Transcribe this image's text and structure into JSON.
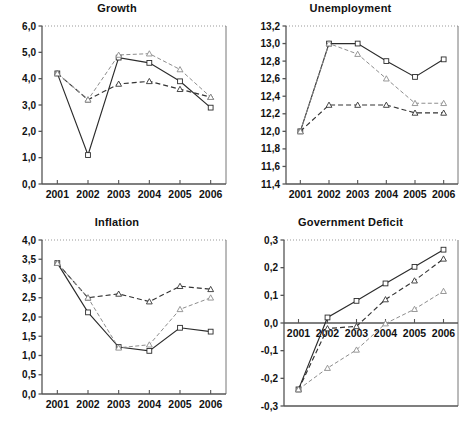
{
  "figure": {
    "background": "#ffffff",
    "panel_count": 4
  },
  "panels": [
    {
      "name": "growth",
      "title": "Growth",
      "ylabel": "",
      "xlabel": ""
    },
    {
      "name": "unemployment",
      "title": "Unemployment",
      "ylabel": "",
      "xlabel": ""
    },
    {
      "name": "inflation",
      "title": "Inflation",
      "ylabel": "",
      "xlabel": ""
    },
    {
      "name": "government-deficit",
      "title": "Government Deficit",
      "ylabel": "",
      "xlabel": ""
    }
  ],
  "style": {
    "series_colors": [
      "#2b2b2b",
      "#333333",
      "#8d8d8d"
    ],
    "axis_color": "#555555",
    "frame_color": "#777777",
    "gridline_top_color": "#999999"
  },
  "chart_data": [
    {
      "type": "line",
      "title": "Growth",
      "xlabel": "",
      "ylabel": "",
      "categories": [
        "2001",
        "2002",
        "2003",
        "2004",
        "2005",
        "2006"
      ],
      "x_tick_labels": [
        "2001",
        "2002",
        "2003",
        "2004",
        "2005",
        "2006"
      ],
      "y_tick_labels": [
        "0,0",
        "1,0",
        "2,0",
        "3,0",
        "4,0",
        "5,0",
        "6,0"
      ],
      "y_ticks": [
        0.0,
        1.0,
        2.0,
        3.0,
        4.0,
        5.0,
        6.0
      ],
      "ylim": [
        0.0,
        6.0
      ],
      "grid": false,
      "legend": "none",
      "series": [
        {
          "name": "series-1",
          "marker": "square",
          "line": "solid",
          "values": [
            4.2,
            1.1,
            4.8,
            4.6,
            3.9,
            2.9
          ]
        },
        {
          "name": "series-2",
          "marker": "triangle",
          "line": "dashed",
          "values": [
            4.2,
            3.2,
            3.8,
            3.9,
            3.6,
            3.3
          ]
        },
        {
          "name": "series-3",
          "marker": "triangle",
          "line": "dashdot",
          "values": [
            4.2,
            3.2,
            4.9,
            4.95,
            4.35,
            3.3
          ]
        }
      ]
    },
    {
      "type": "line",
      "title": "Unemployment",
      "xlabel": "",
      "ylabel": "",
      "categories": [
        "2001",
        "2002",
        "2003",
        "2004",
        "2005",
        "2006"
      ],
      "x_tick_labels": [
        "2001",
        "2002",
        "2003",
        "2004",
        "2005",
        "2006"
      ],
      "y_tick_labels": [
        "11,4",
        "11,6",
        "11,8",
        "12,0",
        "12,2",
        "12,4",
        "12,6",
        "12,8",
        "13,0",
        "13,2"
      ],
      "y_ticks": [
        11.4,
        11.6,
        11.8,
        12.0,
        12.2,
        12.4,
        12.6,
        12.8,
        13.0,
        13.2
      ],
      "ylim": [
        11.4,
        13.2
      ],
      "grid": false,
      "legend": "none",
      "series": [
        {
          "name": "series-1",
          "marker": "square",
          "line": "solid",
          "values": [
            12.0,
            13.0,
            13.0,
            12.8,
            12.62,
            12.82
          ]
        },
        {
          "name": "series-2",
          "marker": "triangle",
          "line": "dashed",
          "values": [
            12.0,
            12.3,
            12.3,
            12.3,
            12.21,
            12.21
          ]
        },
        {
          "name": "series-3",
          "marker": "triangle",
          "line": "dashdot",
          "values": [
            12.0,
            13.0,
            12.88,
            12.6,
            12.32,
            12.32
          ]
        }
      ]
    },
    {
      "type": "line",
      "title": "Inflation",
      "xlabel": "",
      "ylabel": "",
      "categories": [
        "2001",
        "2002",
        "2003",
        "2004",
        "2005",
        "2006"
      ],
      "x_tick_labels": [
        "2001",
        "2002",
        "2003",
        "2004",
        "2005",
        "2006"
      ],
      "y_tick_labels": [
        "0,0",
        "0,5",
        "1,0",
        "1,5",
        "2,0",
        "2,5",
        "3,0",
        "3,5",
        "4,0"
      ],
      "y_ticks": [
        0.0,
        0.5,
        1.0,
        1.5,
        2.0,
        2.5,
        3.0,
        3.5,
        4.0
      ],
      "ylim": [
        0.0,
        4.0
      ],
      "grid": false,
      "legend": "none",
      "series": [
        {
          "name": "series-1",
          "marker": "square",
          "line": "solid",
          "values": [
            3.4,
            2.12,
            1.22,
            1.12,
            1.72,
            1.62
          ]
        },
        {
          "name": "series-2",
          "marker": "triangle",
          "line": "dashed",
          "values": [
            3.4,
            2.5,
            2.6,
            2.4,
            2.8,
            2.72
          ]
        },
        {
          "name": "series-3",
          "marker": "triangle",
          "line": "dashdot",
          "values": [
            3.4,
            2.5,
            1.2,
            1.28,
            2.2,
            2.5
          ]
        }
      ]
    },
    {
      "type": "line",
      "title": "Government Deficit",
      "xlabel": "",
      "ylabel": "",
      "categories": [
        "2001",
        "2002",
        "2003",
        "2004",
        "2005",
        "2006"
      ],
      "x_tick_labels": [
        "2001",
        "2002",
        "2003",
        "2004",
        "2005",
        "2006"
      ],
      "y_tick_labels": [
        "-0,3",
        "-0,2",
        "-0,1",
        "0,0",
        "0,1",
        "0,2",
        "0,3"
      ],
      "y_ticks": [
        -0.3,
        -0.2,
        -0.1,
        0.0,
        0.1,
        0.2,
        0.3
      ],
      "ylim": [
        -0.3,
        0.3
      ],
      "grid": false,
      "legend": "none",
      "zero_axis": true,
      "x_labels_at_zero": true,
      "series": [
        {
          "name": "series-1",
          "marker": "square",
          "line": "solid",
          "values": [
            -0.24,
            0.02,
            0.08,
            0.143,
            0.203,
            0.265
          ]
        },
        {
          "name": "series-2",
          "marker": "triangle",
          "line": "dashed",
          "values": [
            -0.24,
            -0.02,
            -0.012,
            0.085,
            0.153,
            0.232
          ]
        },
        {
          "name": "series-3",
          "marker": "triangle",
          "line": "dashdot",
          "values": [
            -0.24,
            -0.163,
            -0.097,
            -0.002,
            0.05,
            0.115
          ]
        }
      ]
    }
  ]
}
